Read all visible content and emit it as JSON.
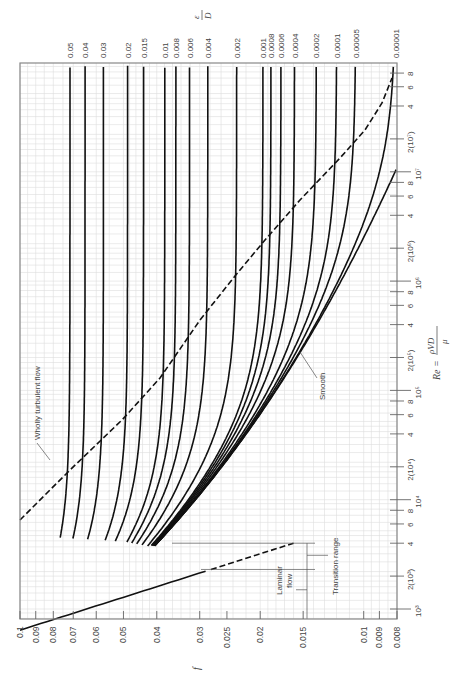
{
  "chart_data": {
    "type": "line",
    "orientation": "rotated-90",
    "xlabel": "Re = ρVD/μ",
    "ylabel": "f",
    "secondary_label": "ε/D",
    "xscale": "log",
    "yscale": "log",
    "xlim": [
      600,
      100000000
    ],
    "ylim": [
      0.008,
      0.1
    ],
    "grid": true,
    "f_ticks": [
      {
        "value": 0.1,
        "label": "0.1"
      },
      {
        "value": 0.09,
        "label": "0.09"
      },
      {
        "value": 0.08,
        "label": "0.08"
      },
      {
        "value": 0.07,
        "label": "0.07"
      },
      {
        "value": 0.06,
        "label": "0.06"
      },
      {
        "value": 0.05,
        "label": "0.05"
      },
      {
        "value": 0.04,
        "label": "0.04"
      },
      {
        "value": 0.03,
        "label": "0.03"
      },
      {
        "value": 0.025,
        "label": "0.025"
      },
      {
        "value": 0.02,
        "label": "0.02"
      },
      {
        "value": 0.015,
        "label": "0.015"
      },
      {
        "value": 0.01,
        "label": "0.01"
      },
      {
        "value": 0.009,
        "label": "0.009"
      },
      {
        "value": 0.008,
        "label": "0.008"
      }
    ],
    "re_ticks": [
      {
        "value": 1000,
        "label": "10³",
        "major": true
      },
      {
        "value": 2000,
        "label": "2(10³)"
      },
      {
        "value": 4000,
        "label": "4"
      },
      {
        "value": 6000,
        "label": "6"
      },
      {
        "value": 8000,
        "label": "8"
      },
      {
        "value": 10000,
        "label": "10⁴",
        "major": true
      },
      {
        "value": 20000,
        "label": "2(10⁴)"
      },
      {
        "value": 40000,
        "label": "4"
      },
      {
        "value": 60000,
        "label": "6"
      },
      {
        "value": 80000,
        "label": "8"
      },
      {
        "value": 100000,
        "label": "10⁵",
        "major": true
      },
      {
        "value": 200000,
        "label": "2(10⁵)"
      },
      {
        "value": 400000,
        "label": "4"
      },
      {
        "value": 600000,
        "label": "6"
      },
      {
        "value": 800000,
        "label": "8"
      },
      {
        "value": 1000000,
        "label": "10⁶",
        "major": true
      },
      {
        "value": 2000000,
        "label": "2(10⁶)"
      },
      {
        "value": 4000000,
        "label": "4"
      },
      {
        "value": 6000000,
        "label": "6"
      },
      {
        "value": 8000000,
        "label": "8"
      },
      {
        "value": 10000000,
        "label": "10⁷",
        "major": true
      },
      {
        "value": 20000000,
        "label": "2(10⁷)"
      },
      {
        "value": 40000000,
        "label": "4"
      },
      {
        "value": 60000000,
        "label": "6"
      },
      {
        "value": 80000000,
        "label": "8"
      }
    ],
    "series": [
      {
        "name": "0.05",
        "roughness": 0.05
      },
      {
        "name": "0.04",
        "roughness": 0.04
      },
      {
        "name": "0.03",
        "roughness": 0.03
      },
      {
        "name": "0.02",
        "roughness": 0.02
      },
      {
        "name": "0.015",
        "roughness": 0.015
      },
      {
        "name": "0.01",
        "roughness": 0.01
      },
      {
        "name": "0.008",
        "roughness": 0.008
      },
      {
        "name": "0.006",
        "roughness": 0.006
      },
      {
        "name": "0.004",
        "roughness": 0.004
      },
      {
        "name": "0.002",
        "roughness": 0.002
      },
      {
        "name": "0.001",
        "roughness": 0.001
      },
      {
        "name": "0.0008",
        "roughness": 0.0008
      },
      {
        "name": "0.0006",
        "roughness": 0.0006
      },
      {
        "name": "0.0004",
        "roughness": 0.0004
      },
      {
        "name": "0.0002",
        "roughness": 0.0002
      },
      {
        "name": "0.0001",
        "roughness": 0.0001
      },
      {
        "name": "0.00005",
        "roughness": 5e-05
      },
      {
        "name": "0.00001",
        "roughness": 1e-05
      },
      {
        "name": "Smooth",
        "roughness": 0
      }
    ],
    "laminar": {
      "equation": "f = 64/Re",
      "re_range": [
        600,
        2300
      ],
      "dashed_range": [
        2300,
        4000
      ]
    },
    "annotations": {
      "wholly_turbulent": "Wholly turbulent flow",
      "smooth": "Smooth",
      "laminar": "Laminar flow",
      "laminar_line1": "Laminar",
      "laminar_line2": "flow",
      "transition": "Transition range",
      "f_symbol": "f",
      "eps_num": "ε",
      "eps_den": "D",
      "re_lhs": "Re =",
      "re_num": "ρVD",
      "re_den": "μ"
    }
  }
}
